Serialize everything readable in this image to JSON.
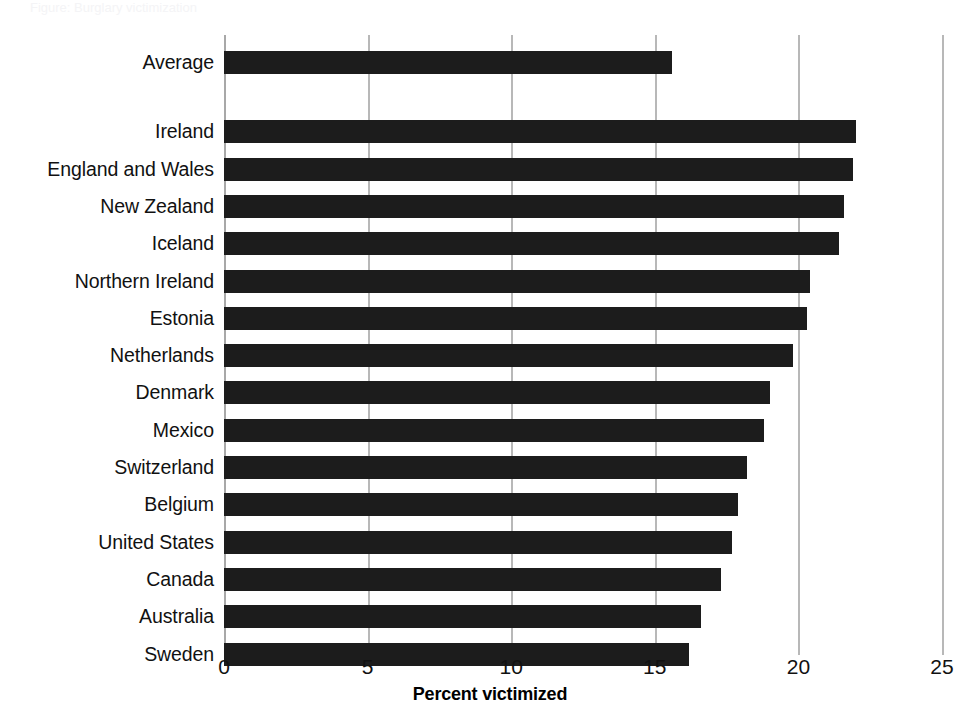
{
  "figure": {
    "ghost_header": "Figure: Burglary victimization",
    "background_color": "#ffffff",
    "bar_color": "#1c1c1c",
    "gridline_color": "#b8b8b8",
    "text_color": "#111111"
  },
  "chart_data": {
    "type": "bar",
    "orientation": "horizontal",
    "title": "",
    "subtitle": "",
    "xlabel": "Percent victimized",
    "ylabel": "",
    "xlim": [
      0,
      25
    ],
    "xticks": [
      0,
      5,
      10,
      15,
      20,
      25
    ],
    "xtick_labels": [
      "0",
      "5",
      "10",
      "15",
      "20",
      "25"
    ],
    "grid": true,
    "grid_axis": "x",
    "legend": false,
    "legend_position": "none",
    "categories": [
      "Average",
      "Ireland",
      "England and Wales",
      "New Zealand",
      "Iceland",
      "Northern Ireland",
      "Estonia",
      "Netherlands",
      "Denmark",
      "Mexico",
      "Switzerland",
      "Belgium",
      "United States",
      "Canada",
      "Australia",
      "Sweden"
    ],
    "values": [
      15.6,
      22.0,
      21.9,
      21.6,
      21.4,
      20.4,
      20.3,
      19.8,
      19.0,
      18.8,
      18.2,
      17.9,
      17.7,
      17.3,
      16.6,
      16.2
    ],
    "separator_after_index": 0,
    "bars": [
      {
        "category": "Average",
        "value": 15.6,
        "group": "average"
      },
      {
        "category": "Ireland",
        "value": 22.0,
        "group": "country"
      },
      {
        "category": "England and Wales",
        "value": 21.9,
        "group": "country"
      },
      {
        "category": "New Zealand",
        "value": 21.6,
        "group": "country"
      },
      {
        "category": "Iceland",
        "value": 21.4,
        "group": "country"
      },
      {
        "category": "Northern Ireland",
        "value": 20.4,
        "group": "country"
      },
      {
        "category": "Estonia",
        "value": 20.3,
        "group": "country"
      },
      {
        "category": "Netherlands",
        "value": 19.8,
        "group": "country"
      },
      {
        "category": "Denmark",
        "value": 19.0,
        "group": "country"
      },
      {
        "category": "Mexico",
        "value": 18.8,
        "group": "country"
      },
      {
        "category": "Switzerland",
        "value": 18.2,
        "group": "country"
      },
      {
        "category": "Belgium",
        "value": 17.9,
        "group": "country"
      },
      {
        "category": "United States",
        "value": 17.7,
        "group": "country"
      },
      {
        "category": "Canada",
        "value": 17.3,
        "group": "country"
      },
      {
        "category": "Australia",
        "value": 16.6,
        "group": "country"
      },
      {
        "category": "Sweden",
        "value": 16.2,
        "group": "country"
      }
    ]
  }
}
